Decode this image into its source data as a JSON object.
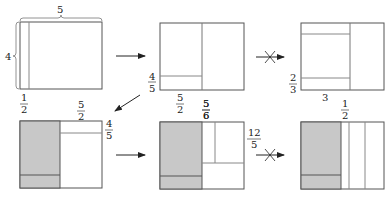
{
  "colors": {
    "stroke": "#555555",
    "thin": "#888888",
    "shade": "#c8c8c8",
    "text": "#222222"
  },
  "panels": [
    {
      "id": "p1",
      "labels": {
        "top": "5",
        "left": "4",
        "bottom_num": "1",
        "bottom_den": "2"
      }
    },
    {
      "id": "p2",
      "labels": {
        "left_num": "4",
        "left_den": "5",
        "bottom1_num": "5",
        "bottom1_den": "2",
        "bottom2_num": "5",
        "bottom2_den": "6"
      }
    },
    {
      "id": "p3",
      "labels": {
        "left_num": "2",
        "left_den": "3",
        "bottom": "3"
      }
    },
    {
      "id": "p4",
      "labels": {
        "top_num": "5",
        "top_den": "2",
        "right_num": "4",
        "right_den": "5"
      }
    },
    {
      "id": "p5",
      "labels": {
        "top_num": "5",
        "top_den": "6",
        "right_num": "12",
        "right_den": "5"
      }
    },
    {
      "id": "p6",
      "labels": {
        "top_num": "1",
        "top_den": "2"
      }
    }
  ],
  "arrows": [
    {
      "from": "p1",
      "to": "p2",
      "type": "allowed"
    },
    {
      "from": "p2",
      "to": "p3",
      "type": "forbidden"
    },
    {
      "from": "p2",
      "to": "p4",
      "type": "allowed"
    },
    {
      "from": "p4",
      "to": "p5",
      "type": "allowed"
    },
    {
      "from": "p5",
      "to": "p6",
      "type": "forbidden"
    }
  ]
}
